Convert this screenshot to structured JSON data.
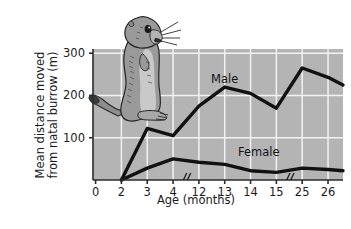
{
  "figure": {
    "illustration_name": "ground-squirrel-illustration",
    "plot_background_color": "#b4b4b4",
    "gridline_color": "#f2f2f2",
    "line_color": "#111111",
    "axis_color": "#2b2b2b"
  },
  "chart_data": {
    "type": "line",
    "title": "",
    "xlabel": "Age (months)",
    "ylabel": "Mean distance moved from natal burrow (m)",
    "x": [
      0,
      2,
      3,
      4,
      12,
      13,
      14,
      15,
      25,
      26
    ],
    "categories": [
      "0",
      "2",
      "3",
      "4",
      "12",
      "13",
      "14",
      "15",
      "25",
      "26"
    ],
    "xtick_labels": [
      "0",
      "2",
      "3",
      "4",
      "12",
      "13",
      "14",
      "15",
      "25",
      "26"
    ],
    "ytick_labels": [
      "100",
      "200",
      "300"
    ],
    "yticks": [
      100,
      200,
      300
    ],
    "ylim": [
      0,
      310
    ],
    "grid": true,
    "legend_position": "inline-labels",
    "axis_breaks": [
      {
        "after": "4",
        "before": "12",
        "symbol": "//"
      },
      {
        "after": "15",
        "before": "25",
        "symbol": "//"
      }
    ],
    "series": [
      {
        "name": "Male",
        "label": "Male",
        "x": [
          2,
          3,
          4,
          12,
          13,
          14,
          15,
          25,
          26
        ],
        "values": [
          0,
          122,
          105,
          175,
          220,
          205,
          170,
          265,
          243
        ]
      },
      {
        "name": "Female",
        "label": "Female",
        "x": [
          2,
          3,
          4,
          12,
          13,
          14,
          15,
          25,
          26
        ],
        "values": [
          0,
          28,
          50,
          42,
          37,
          22,
          18,
          28,
          25
        ]
      }
    ],
    "series_end_values": {
      "Male": 225,
      "Female": 22
    }
  }
}
